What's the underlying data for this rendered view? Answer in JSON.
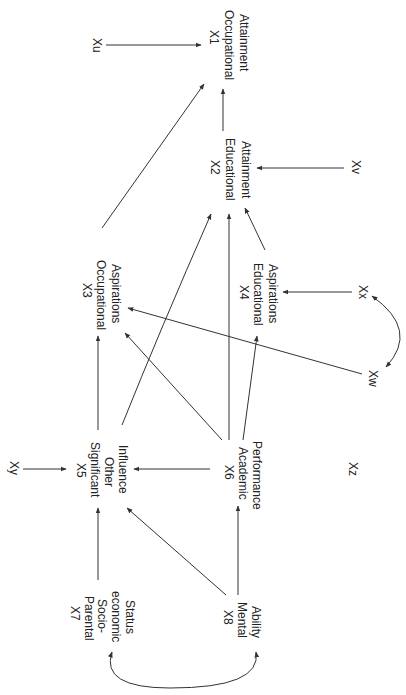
{
  "diagram": {
    "type": "path-diagram",
    "orientation": "rotated-90-clockwise",
    "nodes": {
      "x1": {
        "id": "X1",
        "lines": [
          "Occupational",
          "Attainment"
        ]
      },
      "x2": {
        "id": "X2",
        "lines": [
          "Educational",
          "Attainment"
        ]
      },
      "x3": {
        "id": "X3",
        "lines": [
          "Occupational",
          "Aspirations"
        ]
      },
      "x4": {
        "id": "X4",
        "lines": [
          "Educational",
          "Aspirations"
        ]
      },
      "x5": {
        "id": "X5",
        "lines": [
          "Significant",
          "Other",
          "Influence"
        ]
      },
      "x6": {
        "id": "X6",
        "lines": [
          "Academic",
          "Performance"
        ]
      },
      "x7": {
        "id": "X7",
        "lines": [
          "Parental",
          "Socio-",
          "economic",
          "Status"
        ]
      },
      "x8": {
        "id": "X8",
        "lines": [
          "Mental",
          "Ability"
        ]
      }
    },
    "residuals": {
      "xu": "Xu",
      "xv": "Xv",
      "xw": "Xw",
      "xx": "Xx",
      "xy": "Xy",
      "xz": "Xz"
    },
    "edges": [
      {
        "from": "Xu",
        "to": "X1",
        "type": "directed"
      },
      {
        "from": "X2",
        "to": "X1",
        "type": "directed"
      },
      {
        "from": "X3",
        "to": "X1",
        "type": "directed"
      },
      {
        "from": "Xv",
        "to": "X2",
        "type": "directed"
      },
      {
        "from": "X4",
        "to": "X2",
        "type": "directed"
      },
      {
        "from": "X6",
        "to": "X2",
        "type": "directed"
      },
      {
        "from": "X5",
        "to": "X2",
        "type": "directed"
      },
      {
        "from": "X5",
        "to": "X3",
        "type": "directed"
      },
      {
        "from": "X6",
        "to": "X3",
        "type": "directed"
      },
      {
        "from": "Xw",
        "to": "X3",
        "type": "directed"
      },
      {
        "from": "Xx",
        "to": "X4",
        "type": "directed"
      },
      {
        "from": "X6",
        "to": "X4",
        "type": "directed"
      },
      {
        "from": "Xy",
        "to": "X5",
        "type": "directed"
      },
      {
        "from": "X6",
        "to": "X5",
        "type": "directed"
      },
      {
        "from": "X7",
        "to": "X5",
        "type": "directed"
      },
      {
        "from": "X8",
        "to": "X5",
        "type": "directed"
      },
      {
        "from": "Xz",
        "to": "X6",
        "type": "directed"
      },
      {
        "from": "X8",
        "to": "X6",
        "type": "directed"
      },
      {
        "from": "X7",
        "to": "X8",
        "type": "correlation"
      },
      {
        "from": "Xw",
        "to": "Xx",
        "type": "correlation"
      }
    ],
    "colors": {
      "line": "#333333",
      "text": "#222222",
      "background": "#ffffff"
    }
  }
}
